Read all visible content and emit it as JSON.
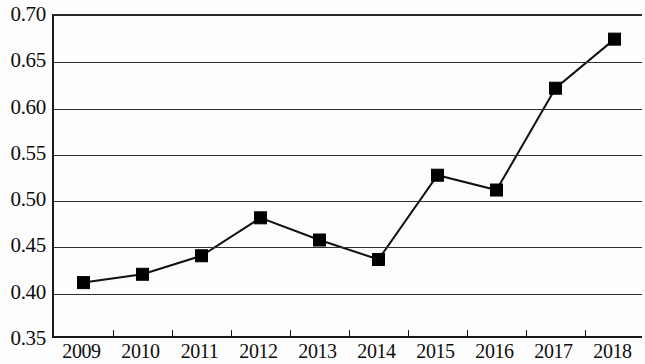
{
  "chart_data": {
    "type": "line",
    "title": "",
    "subtitle": "",
    "xlabel": "",
    "ylabel": "",
    "categories": [
      "2009",
      "2010",
      "2011",
      "2012",
      "2013",
      "2014",
      "2015",
      "2016",
      "2017",
      "2018"
    ],
    "values": [
      0.412,
      0.421,
      0.441,
      0.482,
      0.458,
      0.437,
      0.528,
      0.512,
      0.622,
      0.675
    ],
    "series": [
      {
        "name": "",
        "values": [
          0.412,
          0.421,
          0.441,
          0.482,
          0.458,
          0.437,
          0.528,
          0.512,
          0.622,
          0.675
        ]
      }
    ],
    "ylim": [
      0.35,
      0.7
    ],
    "ytick_labels": [
      "0.70",
      "0.65",
      "0.60",
      "0.55",
      "0.50",
      "0.45",
      "0.40",
      "0.35"
    ],
    "ytick_values": [
      0.7,
      0.65,
      0.6,
      0.55,
      0.5,
      0.45,
      0.4,
      0.35
    ],
    "ytick_step": 0.05,
    "grid": true,
    "grid_axis": "y",
    "legend": false,
    "legend_position": "none",
    "marker": "square",
    "marker_color": "#000000",
    "line_color": "#111111",
    "annotations": []
  }
}
